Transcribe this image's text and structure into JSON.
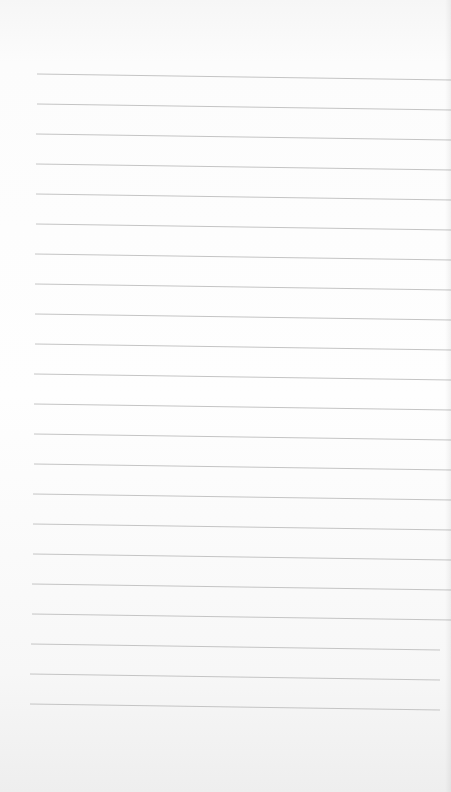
{
  "page": {
    "type": "blank lined paper",
    "line_color": "#c4c4c4",
    "background": "#fdfdfd",
    "line_count": 22,
    "lines": [
      {
        "x1": 37,
        "y1": 74,
        "x2": 451,
        "y2": 80
      },
      {
        "x1": 37,
        "y1": 104,
        "x2": 451,
        "y2": 110
      },
      {
        "x1": 36,
        "y1": 134,
        "x2": 451,
        "y2": 140
      },
      {
        "x1": 36,
        "y1": 164,
        "x2": 451,
        "y2": 170
      },
      {
        "x1": 36,
        "y1": 194,
        "x2": 451,
        "y2": 200
      },
      {
        "x1": 36,
        "y1": 224,
        "x2": 451,
        "y2": 230
      },
      {
        "x1": 35,
        "y1": 254,
        "x2": 451,
        "y2": 260
      },
      {
        "x1": 35,
        "y1": 284,
        "x2": 451,
        "y2": 290
      },
      {
        "x1": 35,
        "y1": 314,
        "x2": 451,
        "y2": 320
      },
      {
        "x1": 35,
        "y1": 344,
        "x2": 451,
        "y2": 350
      },
      {
        "x1": 34,
        "y1": 374,
        "x2": 451,
        "y2": 380
      },
      {
        "x1": 34,
        "y1": 404,
        "x2": 451,
        "y2": 410
      },
      {
        "x1": 34,
        "y1": 434,
        "x2": 451,
        "y2": 440
      },
      {
        "x1": 34,
        "y1": 464,
        "x2": 451,
        "y2": 470
      },
      {
        "x1": 33,
        "y1": 494,
        "x2": 451,
        "y2": 500
      },
      {
        "x1": 33,
        "y1": 524,
        "x2": 451,
        "y2": 530
      },
      {
        "x1": 33,
        "y1": 554,
        "x2": 451,
        "y2": 560
      },
      {
        "x1": 32,
        "y1": 584,
        "x2": 451,
        "y2": 590
      },
      {
        "x1": 32,
        "y1": 614,
        "x2": 451,
        "y2": 620
      },
      {
        "x1": 31,
        "y1": 644,
        "x2": 440,
        "y2": 650
      },
      {
        "x1": 30,
        "y1": 674,
        "x2": 440,
        "y2": 680
      },
      {
        "x1": 30,
        "y1": 704,
        "x2": 440,
        "y2": 710
      }
    ]
  }
}
